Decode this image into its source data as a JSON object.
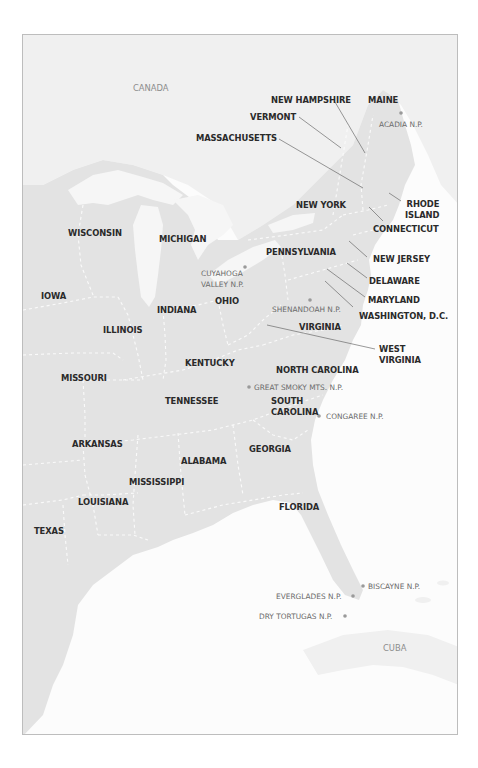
{
  "map": {
    "countries": [
      {
        "id": "canada",
        "label": "CANADA"
      },
      {
        "id": "cuba",
        "label": "CUBA"
      }
    ],
    "states": [
      {
        "id": "maine",
        "label": "MAINE"
      },
      {
        "id": "new-hampshire",
        "label": "NEW HAMPSHIRE"
      },
      {
        "id": "vermont",
        "label": "VERMONT"
      },
      {
        "id": "massachusetts",
        "label": "MASSACHUSETTS"
      },
      {
        "id": "rhode-island",
        "label_lines": [
          "RHODE",
          "ISLAND"
        ]
      },
      {
        "id": "connecticut",
        "label": "CONNECTICUT"
      },
      {
        "id": "new-york",
        "label": "NEW YORK"
      },
      {
        "id": "new-jersey",
        "label": "NEW JERSEY"
      },
      {
        "id": "pennsylvania",
        "label": "PENNSYLVANIA"
      },
      {
        "id": "delaware",
        "label": "DELAWARE"
      },
      {
        "id": "maryland",
        "label": "MARYLAND"
      },
      {
        "id": "washington-dc",
        "label": "WASHINGTON, D.C."
      },
      {
        "id": "virginia",
        "label": "VIRGINIA"
      },
      {
        "id": "west-virginia",
        "label_lines": [
          "WEST",
          "VIRGINIA"
        ]
      },
      {
        "id": "north-carolina",
        "label": "NORTH CAROLINA"
      },
      {
        "id": "south-carolina",
        "label_lines": [
          "SOUTH",
          "CAROLINA"
        ]
      },
      {
        "id": "georgia",
        "label": "GEORGIA"
      },
      {
        "id": "florida",
        "label": "FLORIDA"
      },
      {
        "id": "alabama",
        "label": "ALABAMA"
      },
      {
        "id": "mississippi",
        "label": "MISSISSIPPI"
      },
      {
        "id": "louisiana",
        "label": "LOUISIANA"
      },
      {
        "id": "texas",
        "label": "TEXAS"
      },
      {
        "id": "arkansas",
        "label": "ARKANSAS"
      },
      {
        "id": "tennessee",
        "label": "TENNESSEE"
      },
      {
        "id": "kentucky",
        "label": "KENTUCKY"
      },
      {
        "id": "missouri",
        "label": "MISSOURI"
      },
      {
        "id": "illinois",
        "label": "ILLINOIS"
      },
      {
        "id": "indiana",
        "label": "INDIANA"
      },
      {
        "id": "ohio",
        "label": "OHIO"
      },
      {
        "id": "iowa",
        "label": "IOWA"
      },
      {
        "id": "wisconsin",
        "label": "WISCONSIN"
      },
      {
        "id": "michigan",
        "label": "MICHIGAN"
      }
    ],
    "parks": [
      {
        "id": "acadia",
        "label": "ACADIA N.P."
      },
      {
        "id": "cuyahoga-valley",
        "label_lines": [
          "CUYAHOGA",
          "VALLEY N.P."
        ]
      },
      {
        "id": "shenandoah",
        "label": "SHENANDOAH N.P."
      },
      {
        "id": "great-smoky-mts",
        "label": "GREAT SMOKY MTS. N.P."
      },
      {
        "id": "congaree",
        "label": "CONGAREE N.P."
      },
      {
        "id": "biscayne",
        "label": "BISCAYNE N.P."
      },
      {
        "id": "everglades",
        "label": "EVERGLADES N.P."
      },
      {
        "id": "dry-tortugas",
        "label": "DRY TORTUGAS N.P."
      }
    ],
    "colors": {
      "us_land": "#e3e3e3",
      "foreign_land": "#f0f0f0",
      "water": "#fcfcfc",
      "state_border": "#fafafa",
      "state_label": "#2a2a2a",
      "park_label": "#6a6a6a",
      "country_label": "#8c8c8c",
      "park_dot": "#9a9a9a",
      "frame": "#bdbdbd"
    }
  }
}
